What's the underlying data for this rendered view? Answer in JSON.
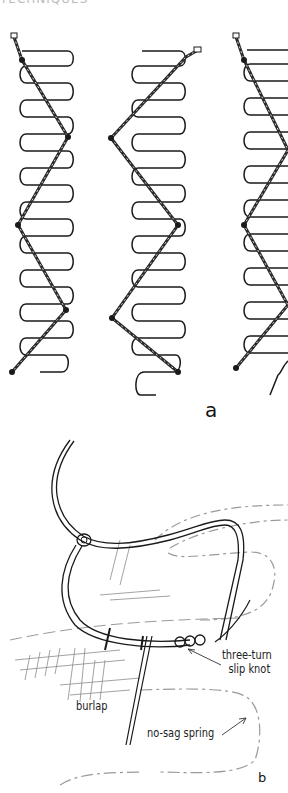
{
  "page": {
    "header_text": "TECHNIQUES"
  },
  "figure_a": {
    "label": "a",
    "description": "three no-sag springs tied with zig-zag twine",
    "springs": [
      {
        "name": "left",
        "coils": 12
      },
      {
        "name": "middle",
        "coils": 12
      },
      {
        "name": "right",
        "coils": 12
      }
    ]
  },
  "figure_b": {
    "label": "b",
    "annotations": {
      "knot_line1": "three-turn",
      "knot_line2": "slip knot",
      "burlap": "burlap",
      "spring": "no-sag spring"
    }
  },
  "colors": {
    "ink": "#1a1a1a",
    "twine": "#2a2a2a",
    "dashed": "#9a9a9a",
    "background": "#ffffff"
  }
}
